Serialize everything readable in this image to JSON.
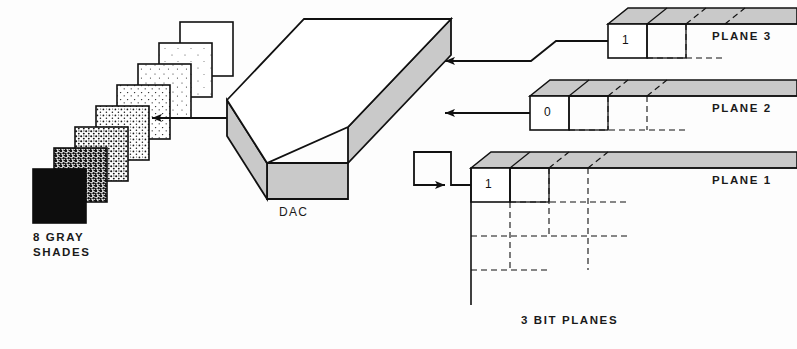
{
  "figure": {
    "kind": "bit-plane to DAC gray shade diagram",
    "background_color": "#fdfdfd",
    "ink_color": "#1a1a1a",
    "face_gray": "#c9c9c9"
  },
  "gray_ramp": {
    "caption_line1": "8 GRAY",
    "caption_line2": "SHADES",
    "count": 8,
    "tiles": [
      {
        "index": 0,
        "name": "shade-black",
        "fill": "#0d0d0d",
        "dot_density": 0
      },
      {
        "index": 1,
        "name": "shade-7",
        "fill": "#ffffff",
        "dot_density": 62
      },
      {
        "index": 2,
        "name": "shade-6",
        "fill": "#ffffff",
        "dot_density": 46
      },
      {
        "index": 3,
        "name": "shade-5",
        "fill": "#ffffff",
        "dot_density": 30
      },
      {
        "index": 4,
        "name": "shade-4",
        "fill": "#ffffff",
        "dot_density": 18
      },
      {
        "index": 5,
        "name": "shade-3",
        "fill": "#ffffff",
        "dot_density": 10
      },
      {
        "index": 6,
        "name": "shade-2",
        "fill": "#ffffff",
        "dot_density": 4
      },
      {
        "index": 7,
        "name": "shade-white",
        "fill": "#ffffff",
        "dot_density": 0
      }
    ]
  },
  "dac": {
    "label": "DAC",
    "top_face_fill": "#ffffff",
    "side_face_fill": "#c9c9c9",
    "input_count": 3,
    "output_count": 1
  },
  "bit_planes": {
    "caption": "3 BIT PLANES",
    "count": 3,
    "planes": [
      {
        "index": 3,
        "label": "PLANE 3",
        "bit_value": "1"
      },
      {
        "index": 2,
        "label": "PLANE 2",
        "bit_value": "0"
      },
      {
        "index": 1,
        "label": "PLANE 1",
        "bit_value": "1"
      }
    ]
  }
}
